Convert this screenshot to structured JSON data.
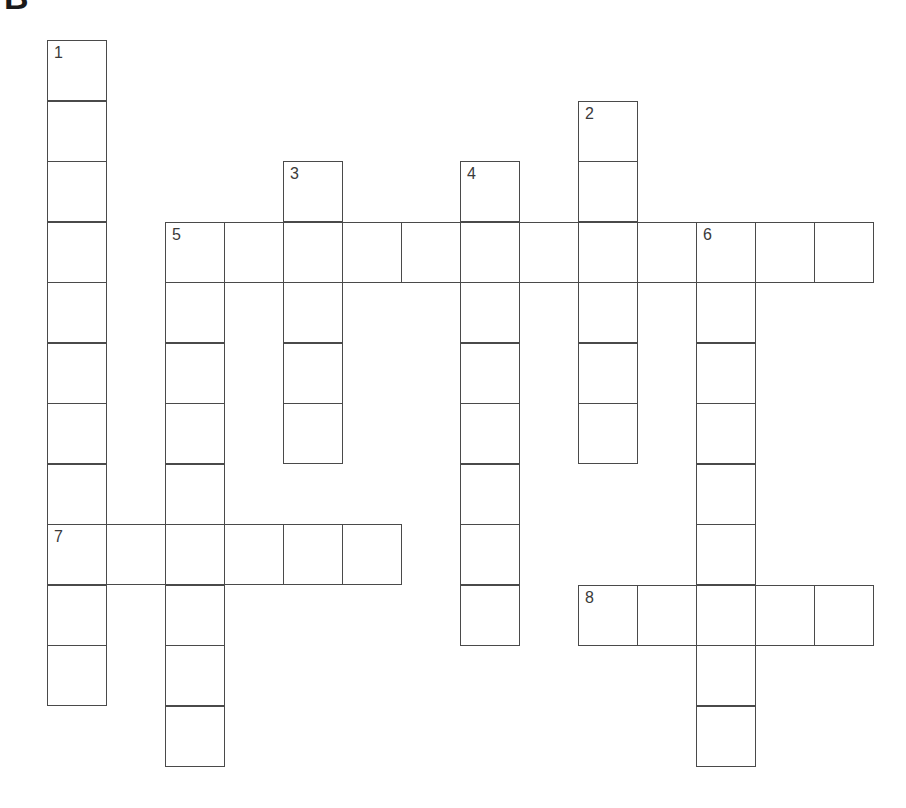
{
  "heading": "B",
  "puzzle": {
    "type": "crossword",
    "cell_size_px": 59,
    "origin": {
      "x": 47,
      "y": 40
    },
    "row_height_px": 60.5,
    "entries": [
      {
        "number": "1",
        "direction": "down",
        "row": 0,
        "col": 0,
        "length": 11
      },
      {
        "number": "2",
        "direction": "down",
        "row": 1,
        "col": 9,
        "length": 6
      },
      {
        "number": "3",
        "direction": "down",
        "row": 2,
        "col": 4,
        "length": 5
      },
      {
        "number": "4",
        "direction": "down",
        "row": 2,
        "col": 7,
        "length": 8
      },
      {
        "number": "5",
        "direction": "across",
        "row": 3,
        "col": 2,
        "length": 12
      },
      {
        "number": "5",
        "direction": "down",
        "row": 3,
        "col": 2,
        "length": 9
      },
      {
        "number": "6",
        "direction": "down",
        "row": 3,
        "col": 11,
        "length": 9
      },
      {
        "number": "7",
        "direction": "across",
        "row": 8,
        "col": 0,
        "length": 6
      },
      {
        "number": "8",
        "direction": "across",
        "row": 9,
        "col": 9,
        "length": 5
      }
    ]
  },
  "colors": {
    "grid_line": "#4a4a4a",
    "cell_bg": "#ffffff",
    "number": "#3a3a3a"
  }
}
